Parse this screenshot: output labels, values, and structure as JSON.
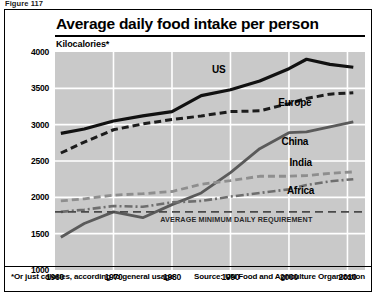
{
  "figure": {
    "caption": "Figure 117"
  },
  "chart": {
    "title": "Average daily food intake per person",
    "unit_label": "Kilocalories*",
    "footnote": "*Or just calories, according to general usage",
    "source": "Source: UN Food and Agriculture Organization",
    "reference_line_label": "AVERAGE MINIMUM DAILY REQUIREMENT",
    "colors": {
      "panel_border": "#000000",
      "plot_background": "#c9c9c9",
      "gridline": "#ffffff",
      "us": "#111111",
      "europe": "#1c1c1c",
      "china": "#5a5a5a",
      "india": "#8e8e8e",
      "africa": "#6e6e6e",
      "reference_line": "#4a4a4a"
    }
  },
  "chart_data": {
    "type": "line",
    "title": "Average daily food intake per person",
    "subtitle": "Kilocalories*",
    "xlabel": "",
    "ylabel": "Kilocalories",
    "xlim": [
      1960,
      2013
    ],
    "ylim": [
      1000,
      4000
    ],
    "yticks": [
      1000,
      1500,
      2000,
      2500,
      3000,
      3500,
      4000
    ],
    "xticks": [
      1960,
      1970,
      1980,
      1990,
      2000,
      2010
    ],
    "grid": true,
    "legend": "inline-labels",
    "annotations": [
      {
        "label": "AVERAGE MINIMUM DAILY REQUIREMENT",
        "type": "horizontal-reference-line",
        "value": 1800
      }
    ],
    "x": [
      1961,
      1965,
      1970,
      1975,
      1980,
      1985,
      1990,
      1995,
      2000,
      2003,
      2007,
      2011
    ],
    "series": [
      {
        "name": "US",
        "style": "solid-thick-black",
        "label_x": 1988,
        "label_y": 3760,
        "values": [
          2880,
          2940,
          3050,
          3120,
          3180,
          3400,
          3480,
          3600,
          3770,
          3900,
          3830,
          3790
        ]
      },
      {
        "name": "Europe",
        "style": "dashed-black",
        "label_x": 2001,
        "label_y": 3310,
        "values": [
          2610,
          2760,
          2930,
          3010,
          3070,
          3120,
          3180,
          3190,
          3290,
          3360,
          3420,
          3440
        ]
      },
      {
        "name": "China",
        "style": "solid-gray",
        "label_x": 2001,
        "label_y": 2780,
        "values": [
          1450,
          1640,
          1800,
          1720,
          1900,
          2060,
          2340,
          2670,
          2890,
          2900,
          2970,
          3040
        ]
      },
      {
        "name": "India",
        "style": "dashed-light-gray",
        "label_x": 2002,
        "label_y": 2480,
        "values": [
          1950,
          1980,
          2030,
          2050,
          2080,
          2180,
          2230,
          2290,
          2290,
          2300,
          2330,
          2350
        ]
      },
      {
        "name": "Africa",
        "style": "dash-dot-gray",
        "label_x": 2002,
        "label_y": 2100,
        "values": [
          1800,
          1830,
          1880,
          1870,
          1930,
          1950,
          2010,
          2060,
          2110,
          2170,
          2220,
          2250
        ]
      }
    ]
  }
}
